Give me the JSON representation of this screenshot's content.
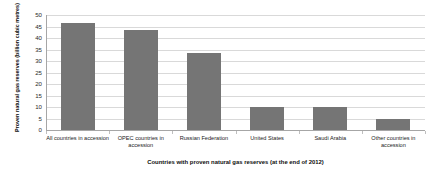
{
  "chart_data": {
    "type": "bar",
    "title": "",
    "xlabel": "Countries with proven natural gas reserves (at the end of 2012)",
    "ylabel": "Proven natural gas reserves (billion cubic metres)",
    "categories": [
      "All countries in accession",
      "OPEC countries in accession",
      "Russian Federation",
      "United States",
      "Saudi Arabia",
      "Other countries in accession"
    ],
    "values": [
      46.5,
      43.5,
      33.5,
      9.8,
      9.8,
      4.8
    ],
    "ylim": [
      0,
      50
    ],
    "yticks": [
      0,
      5,
      10,
      15,
      20,
      25,
      30,
      35,
      40,
      45,
      50
    ],
    "ytick_labels": [
      "0",
      "5",
      "10",
      "15",
      "20",
      "25",
      "30",
      "35",
      "40",
      "45",
      "50"
    ],
    "grid": true,
    "legend": null,
    "bar_color": "#757575",
    "gridline_color": "#d9d9d9",
    "axis_color": "#a6a6a6",
    "background_color": "#ffffff"
  }
}
